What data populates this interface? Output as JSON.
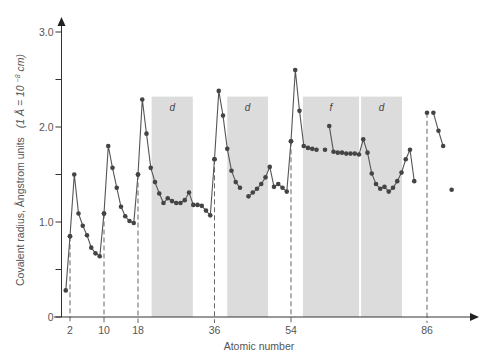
{
  "chart_data": {
    "type": "line",
    "title": "",
    "xlabel": "Atomic number",
    "ylabel": "Covalent radius, Angstrom units  (1 Å = 10⁻⁸cm)",
    "ylabel_main": "Covalent radius, Ångstrom units",
    "ylabel_units": "(1 Å = 10",
    "ylabel_exp": "−8",
    "ylabel_tail": "cm)",
    "ylim": [
      0,
      3.0
    ],
    "xlim": [
      0,
      95
    ],
    "grid": false,
    "legend": null,
    "y_ticks": [
      {
        "value": 0,
        "label": "0"
      },
      {
        "value": 0.5,
        "label": ""
      },
      {
        "value": 1.0,
        "label": "1.0"
      },
      {
        "value": 1.5,
        "label": ""
      },
      {
        "value": 2.0,
        "label": "2.0"
      },
      {
        "value": 2.5,
        "label": ""
      },
      {
        "value": 3.0,
        "label": "3.0"
      }
    ],
    "x_ticks": [
      {
        "value": 2,
        "label": "2"
      },
      {
        "value": 10,
        "label": "10"
      },
      {
        "value": 18,
        "label": "18"
      },
      {
        "value": 36,
        "label": "36"
      },
      {
        "value": 54,
        "label": "54"
      },
      {
        "value": 86,
        "label": "86"
      }
    ],
    "dashed_markers": [
      2,
      10,
      18,
      36,
      54,
      86
    ],
    "shaded_bands": [
      {
        "label": "d",
        "x_start": 21.2,
        "x_end": 30.9
      },
      {
        "label": "d",
        "x_start": 39.0,
        "x_end": 48.6
      },
      {
        "label": "f",
        "x_start": 56.8,
        "x_end": 70.0
      },
      {
        "label": "d",
        "x_start": 70.5,
        "x_end": 80.1
      }
    ],
    "series": [
      {
        "name": "Period 1",
        "points": [
          [
            1,
            0.28
          ],
          [
            2,
            0.85
          ]
        ]
      },
      {
        "name": "Period 2",
        "points": [
          [
            2,
            0.85
          ],
          [
            3,
            1.5
          ],
          [
            4,
            1.09
          ],
          [
            5,
            0.96
          ],
          [
            6,
            0.86
          ],
          [
            7,
            0.73
          ],
          [
            8,
            0.67
          ],
          [
            9,
            0.64
          ],
          [
            10,
            1.09
          ]
        ]
      },
      {
        "name": "Period 3",
        "points": [
          [
            10,
            1.09
          ],
          [
            11,
            1.8
          ],
          [
            12,
            1.57
          ],
          [
            13,
            1.36
          ],
          [
            14,
            1.16
          ],
          [
            15,
            1.06
          ],
          [
            16,
            1.01
          ],
          [
            17,
            0.99
          ],
          [
            18,
            1.5
          ]
        ]
      },
      {
        "name": "Period 4",
        "points": [
          [
            18,
            1.5
          ],
          [
            19,
            2.29
          ],
          [
            20,
            1.93
          ],
          [
            21,
            1.57
          ],
          [
            22,
            1.42
          ],
          [
            23,
            1.3
          ],
          [
            24,
            1.2
          ],
          [
            25,
            1.25
          ],
          [
            26,
            1.22
          ],
          [
            27,
            1.2
          ],
          [
            28,
            1.2
          ],
          [
            29,
            1.23
          ],
          [
            30,
            1.31
          ],
          [
            31,
            1.18
          ],
          [
            32,
            1.18
          ],
          [
            33,
            1.17
          ],
          [
            34,
            1.12
          ],
          [
            35,
            1.07
          ],
          [
            36,
            1.66
          ]
        ]
      },
      {
        "name": "Period 5a",
        "points": [
          [
            36,
            1.66
          ],
          [
            37,
            2.38
          ],
          [
            38,
            2.12
          ],
          [
            39,
            1.77
          ],
          [
            40,
            1.54
          ],
          [
            41,
            1.42
          ],
          [
            42,
            1.36
          ]
        ]
      },
      {
        "name": "Period 5b",
        "points": [
          [
            44,
            1.27
          ],
          [
            45,
            1.31
          ],
          [
            46,
            1.35
          ],
          [
            47,
            1.4
          ],
          [
            48,
            1.47
          ],
          [
            49,
            1.58
          ],
          [
            50,
            1.37
          ],
          [
            51,
            1.4
          ],
          [
            52,
            1.36
          ],
          [
            53,
            1.32
          ],
          [
            54,
            1.85
          ]
        ]
      },
      {
        "name": "Period 6a",
        "points": [
          [
            54,
            1.85
          ],
          [
            55,
            2.6
          ],
          [
            56,
            2.17
          ],
          [
            57,
            1.8
          ],
          [
            58,
            1.78
          ],
          [
            59,
            1.77
          ],
          [
            60,
            1.76
          ]
        ]
      },
      {
        "name": "Period 6 (isolated)",
        "points": [
          [
            62,
            1.76
          ]
        ]
      },
      {
        "name": "Period 6b",
        "points": [
          [
            63,
            2.01
          ],
          [
            64,
            1.74
          ],
          [
            65,
            1.73
          ],
          [
            66,
            1.73
          ],
          [
            67,
            1.72
          ],
          [
            68,
            1.72
          ],
          [
            69,
            1.72
          ],
          [
            70,
            1.71
          ],
          [
            71,
            1.87
          ],
          [
            72,
            1.73
          ],
          [
            73,
            1.51
          ],
          [
            74,
            1.4
          ],
          [
            75,
            1.35
          ],
          [
            76,
            1.37
          ],
          [
            77,
            1.32
          ],
          [
            78,
            1.36
          ],
          [
            79,
            1.43
          ],
          [
            80,
            1.52
          ],
          [
            81,
            1.66
          ],
          [
            82,
            1.76
          ],
          [
            83,
            1.43
          ]
        ]
      },
      {
        "name": "Period 6c (isolated)",
        "points": [
          [
            86,
            2.15
          ]
        ]
      },
      {
        "name": "Period 7",
        "points": [
          [
            87.5,
            2.15
          ],
          [
            88.7,
            1.96
          ],
          [
            89.8,
            1.8
          ]
        ]
      },
      {
        "name": "Isolated",
        "points": [
          [
            91.8,
            1.34
          ]
        ]
      }
    ]
  },
  "plot": {
    "origin_px": [
      61.5,
      317
    ],
    "x_px_per_unit": 4.25,
    "y_px_per_unit": 95,
    "axis_color": "#333333",
    "line_color": "#555555",
    "marker_color": "#444444",
    "band_color": "#dcdcdc"
  }
}
